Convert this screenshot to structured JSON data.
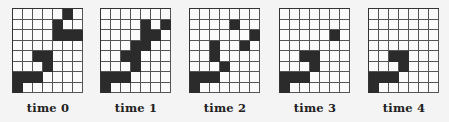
{
  "figure": {
    "rows": 8,
    "cols": 7,
    "colors": {
      "filled": "#2b2b2b",
      "empty": "#fbfbfb",
      "gridline": "#555555"
    },
    "panels": [
      {
        "label": "time 0",
        "filled": [
          [
            0,
            5
          ],
          [
            1,
            4
          ],
          [
            2,
            4
          ],
          [
            2,
            5
          ],
          [
            2,
            6
          ],
          [
            4,
            2
          ],
          [
            4,
            3
          ],
          [
            5,
            3
          ],
          [
            6,
            0
          ],
          [
            6,
            1
          ],
          [
            6,
            2
          ],
          [
            7,
            0
          ]
        ]
      },
      {
        "label": "time 1",
        "filled": [
          [
            1,
            4
          ],
          [
            1,
            6
          ],
          [
            2,
            4
          ],
          [
            2,
            5
          ],
          [
            3,
            3
          ],
          [
            3,
            4
          ],
          [
            4,
            2
          ],
          [
            4,
            3
          ],
          [
            5,
            3
          ],
          [
            6,
            0
          ],
          [
            6,
            1
          ],
          [
            6,
            2
          ],
          [
            7,
            0
          ]
        ]
      },
      {
        "label": "time 2",
        "filled": [
          [
            1,
            4
          ],
          [
            2,
            6
          ],
          [
            3,
            2
          ],
          [
            3,
            5
          ],
          [
            4,
            2
          ],
          [
            5,
            3
          ],
          [
            6,
            0
          ],
          [
            6,
            1
          ],
          [
            6,
            2
          ],
          [
            7,
            0
          ]
        ]
      },
      {
        "label": "time 3",
        "filled": [
          [
            2,
            5
          ],
          [
            4,
            2
          ],
          [
            4,
            3
          ],
          [
            5,
            3
          ],
          [
            6,
            0
          ],
          [
            6,
            1
          ],
          [
            6,
            2
          ],
          [
            7,
            0
          ]
        ]
      },
      {
        "label": "time 4",
        "filled": [
          [
            4,
            2
          ],
          [
            4,
            3
          ],
          [
            5,
            3
          ],
          [
            6,
            0
          ],
          [
            6,
            1
          ],
          [
            6,
            2
          ],
          [
            7,
            0
          ]
        ]
      }
    ]
  }
}
